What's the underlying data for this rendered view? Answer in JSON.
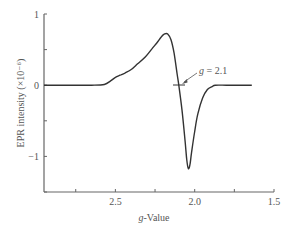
{
  "chart_data": {
    "type": "line",
    "title": "",
    "xlabel": "g-Value",
    "xlabel_italic_part": "g",
    "xlabel_rest": "-Value",
    "ylabel": "EPR intensity (×10⁻⁶)",
    "xlim": [
      2.95,
      1.5
    ],
    "ylim": [
      -1.5,
      1.0
    ],
    "x_reversed": true,
    "grid": false,
    "x_ticks": [
      2.75,
      2.5,
      2.25,
      2.0,
      1.75,
      1.5
    ],
    "x_tick_labels": [
      {
        "value": 2.5,
        "label": "2.5"
      },
      {
        "value": 2.0,
        "label": "2.0"
      },
      {
        "value": 1.5,
        "label": "1.5"
      }
    ],
    "y_ticks": [
      1.0,
      0.5,
      0.0,
      -0.5,
      -1.0,
      -1.5
    ],
    "y_tick_labels": [
      {
        "value": 1,
        "label": "1"
      },
      {
        "value": 0,
        "label": "0"
      },
      {
        "value": -1,
        "label": "−1"
      }
    ],
    "series": [
      {
        "name": "EPR spectrum",
        "color": "#333333",
        "x": [
          2.95,
          2.8,
          2.65,
          2.57,
          2.53,
          2.5,
          2.47,
          2.44,
          2.4,
          2.36,
          2.31,
          2.27,
          2.24,
          2.21,
          2.19,
          2.17,
          2.15,
          2.13,
          2.11,
          2.1,
          2.08,
          2.06,
          2.05,
          2.04,
          2.03,
          2.02,
          2.0,
          1.98,
          1.95,
          1.92,
          1.89,
          1.87,
          1.8,
          1.72,
          1.64
        ],
        "y": [
          0.0,
          0.0,
          0.0,
          0.01,
          0.06,
          0.11,
          0.14,
          0.17,
          0.22,
          0.3,
          0.4,
          0.51,
          0.59,
          0.68,
          0.72,
          0.72,
          0.64,
          0.45,
          0.15,
          0.0,
          -0.35,
          -0.8,
          -1.05,
          -1.17,
          -1.12,
          -0.95,
          -0.65,
          -0.4,
          -0.18,
          -0.06,
          -0.02,
          0.0,
          0.0,
          0.0,
          0.0
        ]
      }
    ],
    "annotations": [
      {
        "text_italic": "g",
        "text_rest": " = 2.1",
        "x": 2.1,
        "y": 0.0,
        "arrow": true,
        "marker": "horizontal tick at zero crossing"
      }
    ]
  }
}
